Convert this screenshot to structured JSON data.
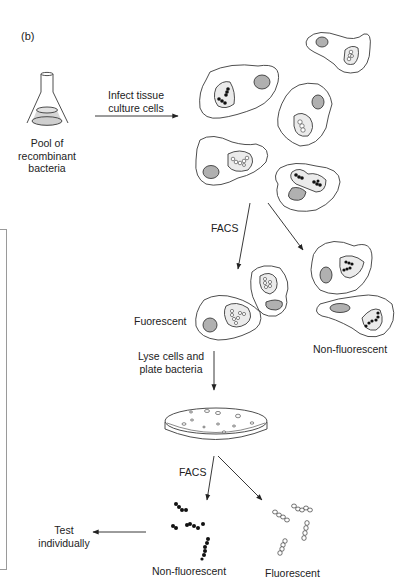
{
  "figure": {
    "panel_label": "(b)",
    "colors": {
      "line": "#3a3a3a",
      "nucleus": "#b0b0b0",
      "vacuole": "#ebebeb",
      "liquid": "#d6d6d6",
      "bacteria_dark": "#111111",
      "frame": "#9a9a9a"
    },
    "steps": {
      "pool": {
        "line1": "Pool of",
        "line2": "recombinant",
        "line3": "bacteria"
      },
      "infect": {
        "line1": "Infect tissue",
        "line2": "culture cells"
      },
      "facs_1": "FACS",
      "fluorescent_cells": "Fuorescent",
      "non_fluorescent_cells": "Non-fluorescent",
      "lyse": {
        "line1": "Lyse cells and",
        "line2": "plate bacteria"
      },
      "facs_2": "FACS",
      "non_fluorescent_bacteria": "Non-fluorescent",
      "fluorescent_bacteria": "Fluorescent",
      "test": {
        "line1": "Test",
        "line2": "individually"
      }
    }
  }
}
